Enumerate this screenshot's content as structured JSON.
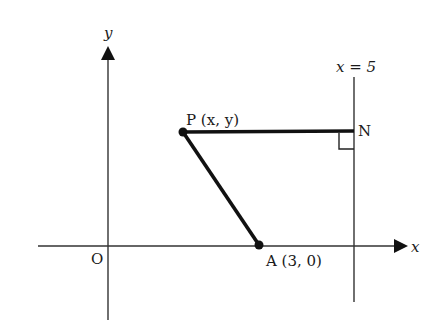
{
  "diagram": {
    "type": "coordinate-geometry",
    "axes": {
      "x_label": "x",
      "y_label": "y",
      "origin_label": "O"
    },
    "line": {
      "label": "x = 5",
      "equation": "x = 5"
    },
    "points": {
      "P": {
        "name": "P",
        "coords": "(x, y)",
        "label": "P (x, y)"
      },
      "N": {
        "name": "N",
        "label": "N"
      },
      "A": {
        "name": "A",
        "coords": "(3, 0)",
        "label": "A (3, 0)"
      }
    },
    "segments": [
      {
        "from": "P",
        "to": "N",
        "note": "horizontal, perpendicular to x = 5"
      },
      {
        "from": "P",
        "to": "A"
      }
    ],
    "right_angle_at": "N",
    "colors": {
      "stroke": "#1a1a1a",
      "axis": "#333333",
      "background": "#ffffff"
    }
  }
}
